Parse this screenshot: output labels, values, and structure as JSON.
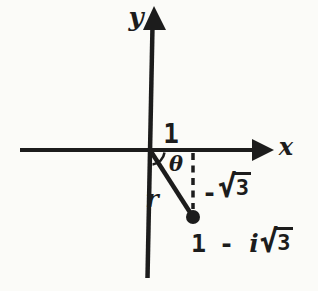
{
  "figure": {
    "background_color": "#fbfbf8",
    "ink_color": "#1c1c1c",
    "x_axis": {
      "label": "x"
    },
    "y_axis": {
      "label": "y"
    },
    "annotations": {
      "real_part": "1",
      "angle": "θ",
      "radius": "r",
      "imag_part": {
        "minus": "-",
        "sqrt": "√",
        "radicand": "3"
      },
      "point_value": {
        "real": "1",
        "minus": "-",
        "imag_unit": "i",
        "sqrt": "√",
        "radicand": "3"
      }
    }
  }
}
